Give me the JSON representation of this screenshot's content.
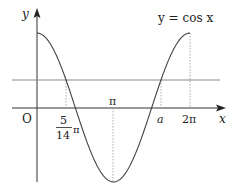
{
  "diagram": {
    "curve_label": "y = cos x",
    "axis_x_label": "x",
    "axis_y_label": "y",
    "origin_label": "O",
    "ticks": {
      "pi": "π",
      "two_pi": "2π",
      "a": "a",
      "frac_num": "5",
      "frac_den": "14",
      "frac_pi": "π"
    },
    "colors": {
      "curve": "#444444",
      "axis": "#333333",
      "horizontal_line": "#777777",
      "guide": "#999999"
    }
  },
  "chart_data": {
    "type": "line",
    "title": "y = cos x",
    "xlabel": "x",
    "ylabel": "y",
    "series": [
      {
        "name": "y = cos x",
        "function": "cos(x)",
        "x_range": [
          0,
          6.2832
        ]
      },
      {
        "name": "horizontal line",
        "function": "y = cos(5π/14)",
        "value": 0.6235
      }
    ],
    "marked_x": [
      "5/14 π",
      "π",
      "a",
      "2π"
    ],
    "intersections": [
      {
        "x": "5π/14"
      },
      {
        "x": "a"
      }
    ],
    "grid": false
  }
}
